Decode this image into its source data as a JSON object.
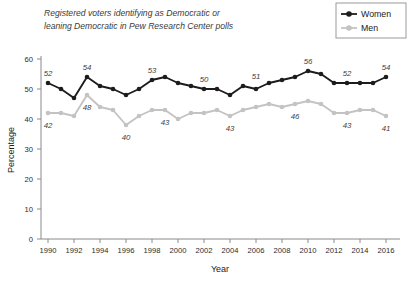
{
  "chart_data": {
    "type": "line",
    "title": "Registered voters identifying as Democratic or leaning Democratic in Pew Research Center polls",
    "title_line1": "Registered voters identifying as Democratic or",
    "title_line2": "leaning Democratic in Pew Research Center polls",
    "xlabel": "Year",
    "ylabel": "Percentage",
    "xlim": [
      1990,
      2016
    ],
    "ylim": [
      0,
      60
    ],
    "xticks": [
      1990,
      1992,
      1994,
      1996,
      1998,
      2000,
      2002,
      2004,
      2006,
      2008,
      2010,
      2012,
      2014,
      2016
    ],
    "yticks": [
      0,
      10,
      20,
      30,
      40,
      50,
      60
    ],
    "grid": false,
    "legend_position": "top-right",
    "x": [
      1990,
      1991,
      1992,
      1993,
      1994,
      1995,
      1996,
      1997,
      1998,
      1999,
      2000,
      2001,
      2002,
      2003,
      2004,
      2005,
      2006,
      2007,
      2008,
      2009,
      2010,
      2011,
      2012,
      2013,
      2014,
      2015,
      2016
    ],
    "series": [
      {
        "name": "Women",
        "color": "#1c1c1c",
        "values": [
          52,
          50,
          47,
          54,
          51,
          50,
          48,
          50,
          53,
          54,
          52,
          51,
          50,
          50,
          48,
          51,
          50,
          52,
          53,
          54,
          56,
          55,
          52,
          52,
          52,
          52,
          54
        ]
      },
      {
        "name": "Men",
        "color": "#c3c3c3",
        "values": [
          42,
          42,
          41,
          48,
          44,
          43,
          38,
          41,
          43,
          43,
          40,
          42,
          42,
          43,
          41,
          43,
          44,
          45,
          44,
          45,
          46,
          45,
          42,
          42,
          43,
          43,
          41
        ]
      }
    ],
    "annotations": [
      {
        "series": "Women",
        "year": 1990,
        "value": 52,
        "text": "52"
      },
      {
        "series": "Women",
        "year": 1993,
        "value": 54,
        "text": "54"
      },
      {
        "series": "Women",
        "year": 1998,
        "value": 53,
        "text": "53"
      },
      {
        "series": "Women",
        "year": 2002,
        "value": 50,
        "text": "50"
      },
      {
        "series": "Women",
        "year": 2006,
        "value": 51,
        "text": "51"
      },
      {
        "series": "Women",
        "year": 2010,
        "value": 56,
        "text": "56"
      },
      {
        "series": "Women",
        "year": 2013,
        "value": 52,
        "text": "52"
      },
      {
        "series": "Women",
        "year": 2016,
        "value": 54,
        "text": "54"
      },
      {
        "series": "Men",
        "year": 1990,
        "value": 42,
        "text": "42"
      },
      {
        "series": "Men",
        "year": 1993,
        "value": 48,
        "text": "48"
      },
      {
        "series": "Men",
        "year": 1996,
        "value": 38,
        "text": "40"
      },
      {
        "series": "Men",
        "year": 1999,
        "value": 43,
        "text": "43"
      },
      {
        "series": "Men",
        "year": 2004,
        "value": 41,
        "text": "43"
      },
      {
        "series": "Men",
        "year": 2009,
        "value": 45,
        "text": "46"
      },
      {
        "series": "Men",
        "year": 2013,
        "value": 42,
        "text": "43"
      },
      {
        "series": "Men",
        "year": 2016,
        "value": 41,
        "text": "41"
      }
    ]
  },
  "legend": {
    "items": [
      {
        "label": "Women",
        "color": "#1c1c1c"
      },
      {
        "label": "Men",
        "color": "#c3c3c3"
      }
    ]
  },
  "colors": {
    "women": "#1c1c1c",
    "men": "#c3c3c3",
    "axis": "#8a8a8a",
    "text": "#1a1a1a",
    "background": "#ffffff"
  }
}
